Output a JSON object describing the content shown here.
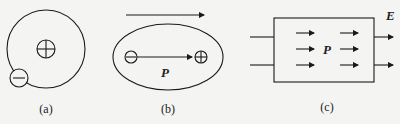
{
  "panels": [
    {
      "id": "a",
      "caption": "(a)",
      "description": "Atom: nucleus (+) with electron (−) on orbit"
    },
    {
      "id": "b",
      "caption": "(b)",
      "description": "Polarized atom in external field; dipole moment",
      "moment_label": "P"
    },
    {
      "id": "c",
      "caption": "(c)",
      "description": "Polarized dielectric slab in field",
      "moment_label": "P",
      "field_label": "E"
    }
  ],
  "colors": {
    "stroke": "#1a1a1a",
    "background": "#f4f4f2"
  }
}
